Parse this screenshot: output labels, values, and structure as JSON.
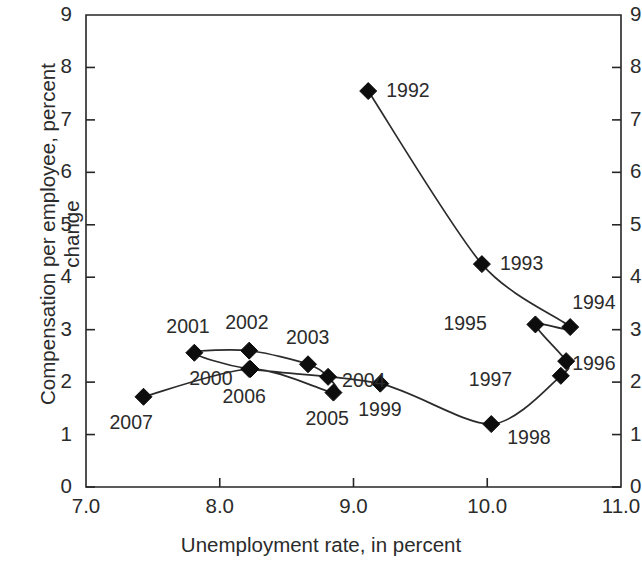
{
  "chart_data": {
    "type": "line",
    "title": "",
    "xlabel": "Unemployment rate, in percent",
    "ylabel": "Compensation per employee, percent change",
    "ylabel_line1": "Compensation per employee, percent",
    "ylabel_line2": "change",
    "xlim": [
      7.0,
      11.0
    ],
    "ylim": [
      0,
      9
    ],
    "xticks": [
      "7.0",
      "8.0",
      "9.0",
      "10.0",
      "11.0"
    ],
    "xtick_values": [
      7.0,
      8.0,
      9.0,
      10.0,
      11.0
    ],
    "yticks": [
      "0",
      "1",
      "2",
      "3",
      "4",
      "5",
      "6",
      "7",
      "8",
      "9"
    ],
    "ytick_values": [
      0,
      1,
      2,
      3,
      4,
      5,
      6,
      7,
      8,
      9
    ],
    "right_axis_yticks": [
      "0",
      "1",
      "2",
      "3",
      "4",
      "5",
      "6",
      "7",
      "8",
      "9"
    ],
    "grid": false,
    "legend": "none",
    "marker": "filled-diamond",
    "series": [
      {
        "name": "Phillips curve path",
        "point_labels": [
          "1992",
          "1993",
          "1994",
          "1995",
          "1996",
          "1997",
          "1998",
          "1999",
          "2000",
          "2001",
          "2002",
          "2003",
          "2004",
          "2005",
          "2006",
          "2007"
        ],
        "x": [
          9.11,
          9.96,
          10.62,
          10.36,
          10.59,
          10.55,
          10.03,
          9.2,
          8.22,
          7.81,
          8.22,
          8.66,
          8.81,
          8.85,
          8.23,
          7.43
        ],
        "y": [
          7.55,
          4.25,
          3.05,
          3.1,
          2.4,
          2.12,
          1.2,
          1.97,
          2.25,
          2.56,
          2.6,
          2.34,
          2.1,
          1.8,
          2.25,
          1.72
        ]
      }
    ],
    "points": [
      {
        "label": "1992",
        "x": 9.11,
        "y": 7.55,
        "label_pos": "right"
      },
      {
        "label": "1993",
        "x": 9.96,
        "y": 4.25,
        "label_pos": "right"
      },
      {
        "label": "1994",
        "x": 10.62,
        "y": 3.05,
        "label_pos": "above-left"
      },
      {
        "label": "1995",
        "x": 10.36,
        "y": 3.1,
        "label_pos": "left"
      },
      {
        "label": "1996",
        "x": 10.59,
        "y": 2.4,
        "label_pos": "right"
      },
      {
        "label": "1997",
        "x": 10.55,
        "y": 2.12,
        "label_pos": "left"
      },
      {
        "label": "1998",
        "x": 10.03,
        "y": 1.2,
        "label_pos": "right"
      },
      {
        "label": "1999",
        "x": 9.2,
        "y": 1.97,
        "label_pos": "below"
      },
      {
        "label": "2000",
        "x": 8.22,
        "y": 2.25,
        "label_pos": "left-below"
      },
      {
        "label": "2001",
        "x": 7.81,
        "y": 2.56,
        "label_pos": "above"
      },
      {
        "label": "2002",
        "x": 8.22,
        "y": 2.6,
        "label_pos": "above"
      },
      {
        "label": "2003",
        "x": 8.66,
        "y": 2.34,
        "label_pos": "above"
      },
      {
        "label": "2004",
        "x": 8.81,
        "y": 2.1,
        "label_pos": "right"
      },
      {
        "label": "2005",
        "x": 8.85,
        "y": 1.8,
        "label_pos": "below"
      },
      {
        "label": "2006",
        "x": 8.23,
        "y": 2.25,
        "label_pos": "below"
      },
      {
        "label": "2007",
        "x": 7.43,
        "y": 1.72,
        "label_pos": "below"
      }
    ]
  },
  "axes": {
    "x_title": "Unemployment rate, in percent",
    "y_title_line1": "Compensation per employee, percent",
    "y_title_line2": "change"
  },
  "tick_text": {
    "x": [
      "7.0",
      "8.0",
      "9.0",
      "10.0",
      "11.0"
    ],
    "y": [
      "9",
      "8",
      "7",
      "6",
      "5",
      "4",
      "3",
      "2",
      "1",
      "0"
    ]
  }
}
